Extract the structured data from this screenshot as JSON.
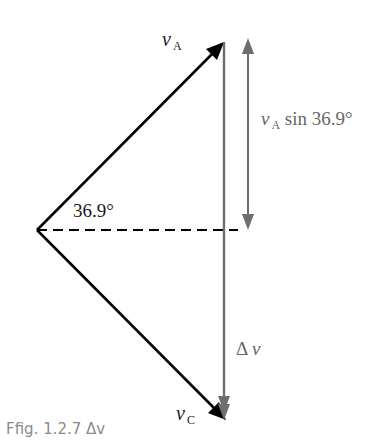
{
  "figure": {
    "caption": "Ffig. 1.2.7 Δv",
    "labels": {
      "va": "v",
      "va_sub": "A",
      "vc": "v",
      "vc_sub": "C",
      "angle": "36.9°",
      "component_v": "v",
      "component_sub": "A",
      "component_rest": "sin 36.9°",
      "delta": "Δ",
      "delta_v": "v"
    },
    "colors": {
      "vector": "#000000",
      "delta_vector": "#6e6e6e",
      "component_arrow": "#6e6e6e",
      "dashed_line": "#000000"
    }
  }
}
